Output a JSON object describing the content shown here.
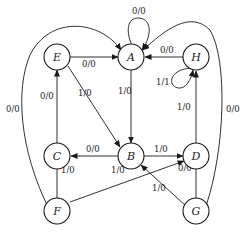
{
  "diagram": {
    "type": "state-transition",
    "nodes": [
      {
        "id": "A",
        "label": "A"
      },
      {
        "id": "B",
        "label": "B"
      },
      {
        "id": "C",
        "label": "C"
      },
      {
        "id": "D",
        "label": "D"
      },
      {
        "id": "E",
        "label": "E"
      },
      {
        "id": "F",
        "label": "F"
      },
      {
        "id": "G",
        "label": "G"
      },
      {
        "id": "H",
        "label": "H"
      }
    ],
    "edges": [
      {
        "from": "A",
        "to": "A",
        "label": "0/0"
      },
      {
        "from": "E",
        "to": "A",
        "label": "0/0"
      },
      {
        "from": "H",
        "to": "A",
        "label": "0/0"
      },
      {
        "from": "H",
        "to": "H",
        "label": "1/1"
      },
      {
        "from": "E",
        "to": "B",
        "label": "1/0"
      },
      {
        "from": "A",
        "to": "B",
        "label": "1/0"
      },
      {
        "from": "C",
        "to": "E",
        "label": "0/0"
      },
      {
        "from": "B",
        "to": "C",
        "label": "0/0"
      },
      {
        "from": "B",
        "to": "D",
        "label": "1/0"
      },
      {
        "from": "D",
        "to": "H",
        "label": "1/0"
      },
      {
        "from": "C",
        "to": "F",
        "label": "1/0"
      },
      {
        "from": "F",
        "to": "D",
        "label": "1/0"
      },
      {
        "from": "D",
        "to": "G",
        "label": "0/0"
      },
      {
        "from": "G",
        "to": "B",
        "label": "1/0"
      },
      {
        "from": "F",
        "to": "A",
        "label": "0/0"
      },
      {
        "from": "G",
        "to": "A",
        "label": "0/0"
      }
    ]
  }
}
